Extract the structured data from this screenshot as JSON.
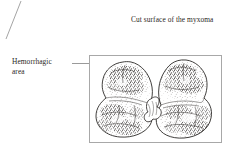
{
  "figure": {
    "type": "medical-illustration",
    "background_color": "#ffffff",
    "frame_color": "#a8a8a8",
    "ink_color": "#231f20",
    "leader_color": "#9a9a9a"
  },
  "annotations": {
    "cut_surface": {
      "text": "Cut surface of the myxoma",
      "leader": "diagonal-down-left"
    },
    "hemorrhagic": {
      "line1": "Hemorrhagic",
      "line2": "area",
      "text": "Hemorrhagic area",
      "leader": "horizontal-right"
    }
  },
  "specimen": {
    "halves": [
      "left-half",
      "right-half"
    ],
    "features": [
      "hemorrhagic-stippling",
      "cut-surface-mottling",
      "central-pale-cleft",
      "smooth-outer-capsule"
    ]
  }
}
